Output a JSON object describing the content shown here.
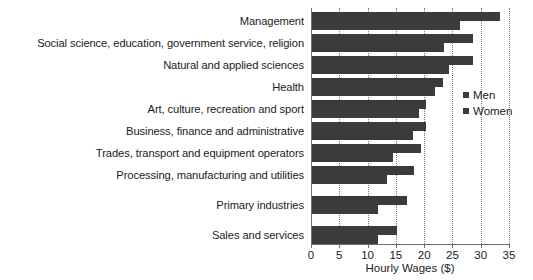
{
  "chart_data": {
    "type": "bar",
    "orientation": "horizontal",
    "title": "",
    "xlabel": "Hourly Wages ($)",
    "ylabel": "",
    "xlim": [
      0,
      35
    ],
    "xticks": [
      0,
      5,
      10,
      15,
      20,
      25,
      30,
      35
    ],
    "xtick_labels": [
      "0",
      "5",
      "10",
      "15",
      "20",
      "25",
      "30",
      "35"
    ],
    "grid": "vertical-dotted",
    "legend_position": "right-middle",
    "categories": [
      "Management",
      "Social science, education, government service, religion",
      "Natural and applied sciences",
      "Health",
      "Art, culture, recreation and sport",
      "Business, finance and administrative",
      "Trades, transport and equipment operators",
      "Processing, manufacturing and utilities",
      "Primary industries",
      "Sales and services"
    ],
    "series": [
      {
        "name": "Men",
        "color": "#3b3b3b",
        "values": [
          33.3,
          28.5,
          28.5,
          23.2,
          20.2,
          20.2,
          19.2,
          18.0,
          16.8,
          15.0
        ]
      },
      {
        "name": "Women",
        "color": "#3b3b3b",
        "values": [
          26.2,
          23.3,
          24.3,
          21.8,
          18.9,
          17.8,
          14.3,
          13.2,
          11.6,
          11.6
        ]
      }
    ]
  },
  "legend": {
    "items": [
      {
        "label": "Men"
      },
      {
        "label": "Women"
      }
    ]
  },
  "colors": {
    "bar": "#3b3b3b",
    "axis": "#6e6e6e",
    "grid": "#7a7a7a",
    "text": "#1b1b1b",
    "background": "#ffffff"
  }
}
